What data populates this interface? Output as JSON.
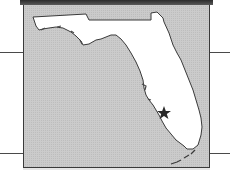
{
  "map": {
    "region": "Florida",
    "marker": {
      "type": "star",
      "label": "",
      "color": "#2a2a2a"
    },
    "colors": {
      "water": "#c9c9c9",
      "land": "#ffffff",
      "outline": "#3a3a3a",
      "frame": "#3a3a3a",
      "top_band": "#2c2c2c"
    }
  }
}
